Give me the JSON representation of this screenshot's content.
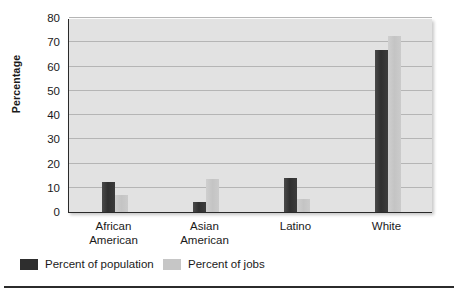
{
  "chart_data": {
    "type": "bar",
    "title": "",
    "xlabel": "",
    "ylabel": "Percentage",
    "ylim": [
      0,
      80
    ],
    "yticks": [
      0,
      10,
      20,
      30,
      40,
      50,
      60,
      70,
      80
    ],
    "grid": true,
    "legend_position": "bottom-left",
    "categories": [
      "African American",
      "Asian American",
      "Latino",
      "White"
    ],
    "category_lines": [
      [
        "African",
        "American"
      ],
      [
        "Asian",
        "American"
      ],
      [
        "Latino"
      ],
      [
        "White"
      ]
    ],
    "series": [
      {
        "name": "Percent of population",
        "color": "#2e2e2e",
        "values": [
          12.5,
          4,
          14,
          67
        ]
      },
      {
        "name": "Percent of jobs",
        "color": "#c6c6c6",
        "values": [
          7,
          13.5,
          5.5,
          72.5
        ]
      }
    ]
  },
  "colors": {
    "plot_background": "#e2e2e2",
    "gridline": "#b5b5b5",
    "axis": "#2a2a2a",
    "series_population": "#2e2e2e",
    "series_jobs": "#c6c6c6",
    "page_background": "#ffffff",
    "text": "#1a1a1a"
  }
}
